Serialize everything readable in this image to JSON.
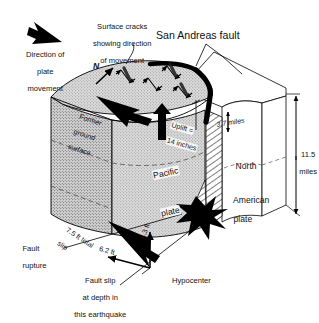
{
  "figure": {
    "type": "geologic-block-diagram",
    "background_color": "#ffffff",
    "ink_color": "#000000",
    "block_fill": "#d8d8d8"
  },
  "annotations": {
    "plate_motion": {
      "line1": "Direction of",
      "line2": "plate",
      "line3": "movement",
      "arrow_icon": "thick-arrow-upleft"
    },
    "surface_cracks": {
      "line1": "Surface cracks",
      "line2": "showing direction",
      "line3": "of movement"
    },
    "fault_name": "San Andreas fault",
    "north_arrow_label": "N",
    "former_surface": {
      "line1": "Former",
      "line2": "ground",
      "line3": "surface"
    },
    "uplift": {
      "line1": "Uplift =",
      "line2": "14 inches"
    },
    "depth_to_fault_top": "3.7 miles",
    "block_depth": {
      "line1": "11.5",
      "line2": "miles"
    },
    "pacific_plate": {
      "line1": "Pacific",
      "line2": "plate"
    },
    "north_american_plate": {
      "line1": "North",
      "line2": "American",
      "line3": "plate"
    },
    "fault_rupture": {
      "line1": "Fault",
      "line2": "rupture"
    },
    "hypocenter": "Hypocenter",
    "total_slip": {
      "line1": "7.5 ft total",
      "line2": "slip"
    },
    "horizontal_slip": "6.2 ft",
    "vertical_slip": "4.3 ft",
    "fault_slip_caption": {
      "line1": "Fault slip",
      "line2": "at depth in",
      "line3": "this earthquake"
    }
  },
  "measurements": [
    {
      "name": "uplift",
      "value": "14",
      "unit": "inches"
    },
    {
      "name": "depth to top of rupture",
      "value": "3.7",
      "unit": "miles"
    },
    {
      "name": "block depth",
      "value": "11.5",
      "unit": "miles"
    },
    {
      "name": "total slip",
      "value": "7.5",
      "unit": "ft"
    },
    {
      "name": "horizontal slip component",
      "value": "6.2",
      "unit": "ft"
    },
    {
      "name": "vertical slip component",
      "value": "4.3",
      "unit": "ft"
    }
  ]
}
